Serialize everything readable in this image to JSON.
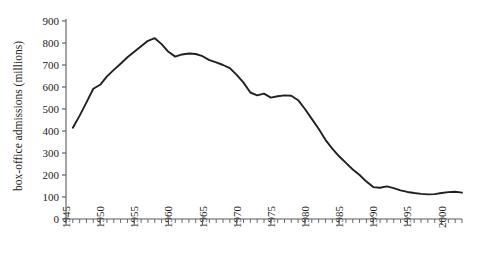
{
  "chart_data": {
    "type": "line",
    "title": "",
    "xlabel": "",
    "ylabel": "box-office admissions (millions)",
    "ylim": [
      0,
      900
    ],
    "xlim": [
      1945,
      2003
    ],
    "ytick_labels": [
      "0",
      "100",
      "200",
      "300",
      "400",
      "500",
      "600",
      "700",
      "800",
      "900"
    ],
    "ytick_values": [
      0,
      100,
      200,
      300,
      400,
      500,
      600,
      700,
      800,
      900
    ],
    "xtick_labels": [
      "1945",
      "1950",
      "1955",
      "1960",
      "1965",
      "1970",
      "1975",
      "1980",
      "1985",
      "1990",
      "1995",
      "2000"
    ],
    "xtick_values": [
      1945,
      1950,
      1955,
      1960,
      1965,
      1970,
      1975,
      1980,
      1985,
      1990,
      1995,
      2000
    ],
    "minor_tick_interval": 1,
    "grid": false,
    "legend": false,
    "line_color": "#231f20",
    "axis_color": "#5a5a5a",
    "x": [
      1946,
      1947,
      1948,
      1949,
      1950,
      1951,
      1952,
      1953,
      1954,
      1955,
      1956,
      1957,
      1958,
      1959,
      1960,
      1961,
      1962,
      1963,
      1964,
      1965,
      1966,
      1967,
      1968,
      1969,
      1970,
      1971,
      1972,
      1973,
      1974,
      1975,
      1976,
      1977,
      1978,
      1979,
      1980,
      1981,
      1982,
      1983,
      1984,
      1985,
      1986,
      1987,
      1988,
      1989,
      1990,
      1991,
      1992,
      1993,
      1994,
      1995,
      1996,
      1997,
      1998,
      1999,
      2000,
      2001,
      2002,
      2003
    ],
    "y": [
      415,
      470,
      530,
      592,
      610,
      648,
      678,
      706,
      735,
      760,
      785,
      810,
      822,
      795,
      760,
      738,
      748,
      752,
      750,
      740,
      722,
      712,
      700,
      686,
      655,
      620,
      575,
      562,
      570,
      552,
      558,
      562,
      560,
      540,
      500,
      455,
      410,
      360,
      320,
      285,
      255,
      225,
      200,
      170,
      145,
      142,
      148,
      140,
      130,
      123,
      118,
      114,
      112,
      113,
      118,
      122,
      124,
      120,
      135,
      132,
      128,
      130,
      135,
      134,
      132
    ],
    "series_name": "box-office admissions"
  }
}
